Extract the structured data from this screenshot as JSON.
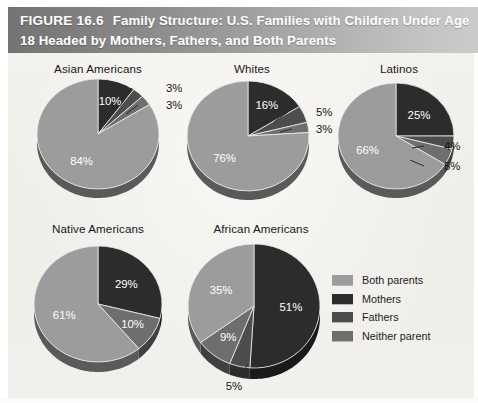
{
  "figure": {
    "number_label": "FIGURE 16.6",
    "title": "Family Structure: U.S. Families with Children Under Age 18 Headed by Mothers, Fathers, and Both Parents"
  },
  "colors": {
    "both_parents": "#9c9c9c",
    "mothers": "#2c2c2c",
    "fathers": "#4d4d4d",
    "neither_parent": "#6e6e6e",
    "background": "#f2f1ed",
    "title_bar_left": "#737373",
    "title_bar_right": "#cbcbcb",
    "title_text": "#ffffff",
    "label_text": "#17171a",
    "inside_label_text": "#ffffff"
  },
  "legend": {
    "items": [
      {
        "label": "Both parents",
        "color_key": "both_parents"
      },
      {
        "label": "Mothers",
        "color_key": "mothers"
      },
      {
        "label": "Fathers",
        "color_key": "fathers"
      },
      {
        "label": "Neither parent",
        "color_key": "neither_parent"
      }
    ]
  },
  "chart_data": {
    "type": "pie",
    "title": "Family Structure: U.S. Families with Children Under Age 18 Headed by Mothers, Fathers, and Both Parents",
    "categories": [
      "Both parents",
      "Mothers",
      "Fathers",
      "Neither parent"
    ],
    "value_unit": "%",
    "legend_position": "right-bottom",
    "slice_order_clockwise_from_top": [
      "Mothers",
      "Fathers",
      "Neither parent",
      "Both parents"
    ],
    "charts": [
      {
        "name": "Asian Americans",
        "labels": [
          "Mothers",
          "Fathers",
          "Neither parent",
          "Both parents"
        ],
        "values": [
          10,
          3,
          3,
          84
        ],
        "display": [
          "10%",
          "3%",
          "3%",
          "84%"
        ],
        "label_placement": [
          "inside",
          "outside",
          "outside",
          "inside"
        ]
      },
      {
        "name": "Whites",
        "labels": [
          "Mothers",
          "Fathers",
          "Neither parent",
          "Both parents"
        ],
        "values": [
          16,
          5,
          3,
          76
        ],
        "display": [
          "16%",
          "5%",
          "3%",
          "76%"
        ],
        "label_placement": [
          "inside",
          "outside",
          "outside",
          "inside"
        ]
      },
      {
        "name": "Latinos",
        "labels": [
          "Mothers",
          "Fathers",
          "Neither parent",
          "Both parents"
        ],
        "values": [
          25,
          4,
          5,
          66
        ],
        "display": [
          "25%",
          "4%",
          "5%",
          "66%"
        ],
        "label_placement": [
          "inside",
          "outside",
          "outside",
          "inside"
        ]
      },
      {
        "name": "Native Americans",
        "labels": [
          "Mothers",
          "Fathers",
          "Neither parent",
          "Both parents"
        ],
        "values": [
          29,
          0,
          10,
          61
        ],
        "display": [
          "29%",
          "",
          "10%",
          "61%"
        ],
        "label_placement": [
          "inside",
          "none",
          "inside",
          "inside"
        ]
      },
      {
        "name": "African Americans",
        "labels": [
          "Mothers",
          "Fathers",
          "Neither parent",
          "Both parents"
        ],
        "values": [
          51,
          5,
          9,
          35
        ],
        "display": [
          "51%",
          "5%",
          "9%",
          "35%"
        ],
        "label_placement": [
          "inside",
          "outside",
          "inside",
          "inside"
        ]
      }
    ]
  }
}
